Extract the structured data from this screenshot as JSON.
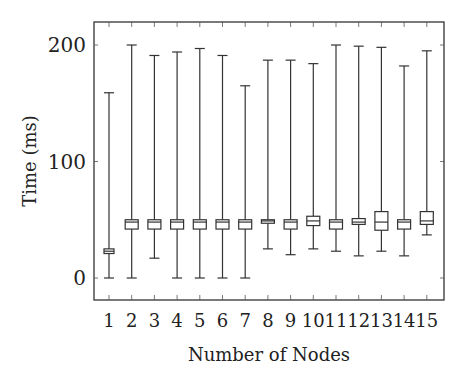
{
  "chart_data": {
    "type": "boxplot",
    "title": "",
    "xlabel": "Number of Nodes",
    "ylabel": "Time (ms)",
    "ylim": [
      -20,
      220
    ],
    "yticks": [
      0,
      100,
      200
    ],
    "grid": false,
    "legend": null,
    "categories": [
      "1",
      "2",
      "3",
      "4",
      "5",
      "6",
      "7",
      "8",
      "9",
      "10",
      "11",
      "12",
      "13",
      "14",
      "15"
    ],
    "boxes": [
      {
        "x": "1",
        "whisker_low": 0,
        "q1": 21,
        "median": 23,
        "q3": 25,
        "whisker_high": 159
      },
      {
        "x": "2",
        "whisker_low": 0,
        "q1": 42,
        "median": 48,
        "q3": 50,
        "whisker_high": 200
      },
      {
        "x": "3",
        "whisker_low": 17,
        "q1": 42,
        "median": 48,
        "q3": 50,
        "whisker_high": 191
      },
      {
        "x": "4",
        "whisker_low": 0,
        "q1": 42,
        "median": 48,
        "q3": 50,
        "whisker_high": 194
      },
      {
        "x": "5",
        "whisker_low": 0,
        "q1": 42,
        "median": 48,
        "q3": 50,
        "whisker_high": 197
      },
      {
        "x": "6",
        "whisker_low": 0,
        "q1": 42,
        "median": 48,
        "q3": 50,
        "whisker_high": 191
      },
      {
        "x": "7",
        "whisker_low": 0,
        "q1": 42,
        "median": 48,
        "q3": 50,
        "whisker_high": 165
      },
      {
        "x": "8",
        "whisker_low": 25,
        "q1": 47,
        "median": 49,
        "q3": 50,
        "whisker_high": 187
      },
      {
        "x": "9",
        "whisker_low": 20,
        "q1": 42,
        "median": 48,
        "q3": 50,
        "whisker_high": 187
      },
      {
        "x": "10",
        "whisker_low": 25,
        "q1": 45,
        "median": 49,
        "q3": 53,
        "whisker_high": 184
      },
      {
        "x": "11",
        "whisker_low": 23,
        "q1": 42,
        "median": 48,
        "q3": 50,
        "whisker_high": 200
      },
      {
        "x": "12",
        "whisker_low": 19,
        "q1": 46,
        "median": 48,
        "q3": 51,
        "whisker_high": 199
      },
      {
        "x": "13",
        "whisker_low": 23,
        "q1": 41,
        "median": 48,
        "q3": 57,
        "whisker_high": 198
      },
      {
        "x": "14",
        "whisker_low": 19,
        "q1": 42,
        "median": 48,
        "q3": 50,
        "whisker_high": 182
      },
      {
        "x": "15",
        "whisker_low": 37,
        "q1": 46,
        "median": 49,
        "q3": 57,
        "whisker_high": 195
      }
    ]
  },
  "axes": {
    "x_title": "Number of Nodes",
    "y_title": "Time (ms)",
    "y_tick_labels": [
      "0",
      "100",
      "200"
    ],
    "x_tick_labels": [
      "1",
      "2",
      "3",
      "4",
      "5",
      "6",
      "7",
      "8",
      "9",
      "10",
      "11",
      "12",
      "13",
      "14",
      "15"
    ]
  },
  "colors": {
    "line": "#333333",
    "background": "#ffffff"
  }
}
